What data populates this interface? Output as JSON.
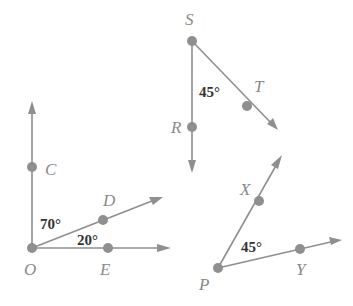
{
  "colors": {
    "line": "#8f8f8f",
    "label": "#8a8a8a",
    "angle_text": "#333333",
    "background": "#ffffff"
  },
  "figures": [
    {
      "vertex": "O",
      "labels": {
        "O": "O",
        "C": "C",
        "D": "D",
        "E": "E"
      },
      "angles": [
        {
          "between": [
            "OC",
            "OD"
          ],
          "text": "70°"
        },
        {
          "between": [
            "OD",
            "OE"
          ],
          "text": "20°"
        }
      ]
    },
    {
      "vertex": "S",
      "labels": {
        "S": "S",
        "R": "R",
        "T": "T"
      },
      "angles": [
        {
          "between": [
            "SR",
            "ST"
          ],
          "text": "45°"
        }
      ]
    },
    {
      "vertex": "P",
      "labels": {
        "P": "P",
        "X": "X",
        "Y": "Y"
      },
      "angles": [
        {
          "between": [
            "PX",
            "PY"
          ],
          "text": "45°"
        }
      ]
    }
  ]
}
